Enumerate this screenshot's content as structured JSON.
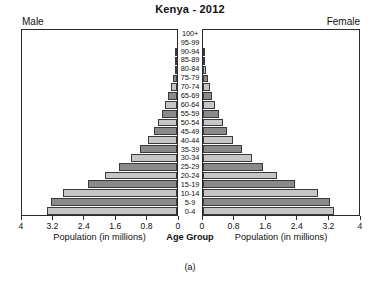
{
  "chart_data": {
    "type": "bar",
    "subtype": "population-pyramid",
    "title": "Kenya - 2012",
    "caption": "(a)",
    "xlabel": "Population (in millions)",
    "ylabel": "Age Group",
    "center_axis_label": "Age Group",
    "left_series_label": "Male",
    "right_series_label": "Female",
    "xlim": [
      0,
      4
    ],
    "xticks": [
      0,
      0.8,
      1.6,
      2.4,
      3.2,
      4
    ],
    "left_tick_labels": [
      "4",
      "3.2",
      "2.4",
      "1.6",
      "0.8",
      "0"
    ],
    "right_tick_labels": [
      "0",
      "0.8",
      "1.6",
      "2.4",
      "3.2",
      "4"
    ],
    "grid": false,
    "legend": "none",
    "bar_colors": {
      "dark": "#8a8a8a",
      "light": "#c6c6c6",
      "outline": "#3a3a3a"
    },
    "categories": [
      "100+",
      "95-99",
      "90-94",
      "85-89",
      "80-84",
      "75-79",
      "70-74",
      "65-69",
      "60-64",
      "55-59",
      "50-54",
      "45-49",
      "40-44",
      "35-39",
      "30-34",
      "25-29",
      "20-24",
      "15-19",
      "10-14",
      "5-9",
      "0-4"
    ],
    "series": [
      {
        "name": "Male",
        "side": "left",
        "units": "millions",
        "values": [
          0.002,
          0.006,
          0.015,
          0.03,
          0.06,
          0.1,
          0.15,
          0.22,
          0.3,
          0.38,
          0.48,
          0.6,
          0.75,
          0.95,
          1.2,
          1.5,
          1.85,
          2.3,
          2.95,
          3.25,
          3.35
        ]
      },
      {
        "name": "Female",
        "side": "right",
        "units": "millions",
        "values": [
          0.003,
          0.008,
          0.02,
          0.04,
          0.075,
          0.12,
          0.17,
          0.24,
          0.32,
          0.4,
          0.5,
          0.62,
          0.78,
          1.0,
          1.25,
          1.55,
          1.9,
          2.35,
          2.95,
          3.25,
          3.35
        ]
      }
    ]
  }
}
